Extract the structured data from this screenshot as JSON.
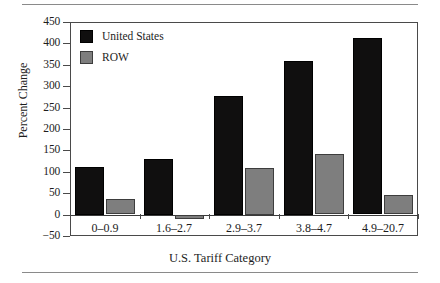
{
  "chart_data": {
    "type": "bar",
    "title": "",
    "xlabel": "U.S. Tariff Category",
    "ylabel": "Percent Change",
    "categories": [
      "0–0.9",
      "1.6–2.7",
      "2.9–3.7",
      "3.8–4.7",
      "4.9–20.7"
    ],
    "series": [
      {
        "name": "United States",
        "color": "#100f0f",
        "values": [
          112,
          130,
          278,
          360,
          412
        ]
      },
      {
        "name": "ROW",
        "color": "#7e7e7e",
        "values": [
          36,
          -10,
          110,
          141,
          45
        ]
      }
    ],
    "ylim": [
      -50,
      450
    ],
    "yticks": [
      450,
      400,
      350,
      300,
      250,
      200,
      150,
      100,
      50,
      0,
      -50
    ],
    "ytick_labels": [
      "450",
      "400",
      "350",
      "300",
      "250",
      "200",
      "150",
      "100",
      "50",
      "0",
      "−50"
    ],
    "grid": false,
    "legend_position": "top-left"
  },
  "legend": {
    "items": [
      {
        "label": "United States",
        "swatch": "black-square-swatch"
      },
      {
        "label": "ROW",
        "swatch": "gray-square-swatch"
      }
    ]
  }
}
